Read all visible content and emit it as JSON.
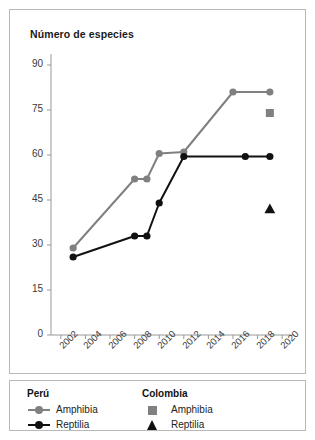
{
  "chart_data": {
    "type": "line",
    "title": "Número de especies",
    "xlabel": "",
    "ylabel": "Número de especies",
    "xlim": [
      2001.2,
      2020.8
    ],
    "ylim": [
      0,
      93
    ],
    "grid": false,
    "legend_position": "below-plot",
    "y_ticks": [
      0,
      15,
      30,
      45,
      60,
      75,
      90
    ],
    "x_ticks": [
      2002,
      2004,
      2006,
      2008,
      2010,
      2012,
      2014,
      2016,
      2018,
      2020
    ],
    "series": [
      {
        "name": "Perú — Amphibia",
        "group": "Perú",
        "taxon": "Amphibia",
        "marker": "circle",
        "color": "#808080",
        "style": "line+marker",
        "points": [
          {
            "x": 2003,
            "y": 29
          },
          {
            "x": 2008,
            "y": 52
          },
          {
            "x": 2009,
            "y": 52
          },
          {
            "x": 2010,
            "y": 60.5
          },
          {
            "x": 2012,
            "y": 61
          },
          {
            "x": 2016,
            "y": 81
          },
          {
            "x": 2019,
            "y": 81
          }
        ]
      },
      {
        "name": "Perú — Reptilia",
        "group": "Perú",
        "taxon": "Reptilia",
        "marker": "circle",
        "color": "#111111",
        "style": "line+marker",
        "points": [
          {
            "x": 2003,
            "y": 26
          },
          {
            "x": 2008,
            "y": 33
          },
          {
            "x": 2009,
            "y": 33
          },
          {
            "x": 2010,
            "y": 44
          },
          {
            "x": 2012,
            "y": 59.5
          },
          {
            "x": 2017,
            "y": 59.5
          },
          {
            "x": 2019,
            "y": 59.5
          }
        ]
      },
      {
        "name": "Colombia — Amphibia",
        "group": "Colombia",
        "taxon": "Amphibia",
        "marker": "square",
        "color": "#808080",
        "style": "marker-only",
        "points": [
          {
            "x": 2019,
            "y": 74
          }
        ]
      },
      {
        "name": "Colombia — Reptilia",
        "group": "Colombia",
        "taxon": "Reptilia",
        "marker": "triangle",
        "color": "#111111",
        "style": "marker-only",
        "points": [
          {
            "x": 2019,
            "y": 42
          }
        ]
      }
    ]
  },
  "legend": {
    "groups": [
      {
        "heading": "Perú",
        "entries": [
          {
            "label": "Amphibia",
            "marker": "circle",
            "color": "#808080",
            "line": true
          },
          {
            "label": "Reptilia",
            "marker": "circle",
            "color": "#111111",
            "line": true
          }
        ]
      },
      {
        "heading": "Colombia",
        "entries": [
          {
            "label": "Amphibia",
            "marker": "square",
            "color": "#808080",
            "line": false
          },
          {
            "label": "Reptilia",
            "marker": "triangle",
            "color": "#111111",
            "line": false
          }
        ]
      }
    ]
  },
  "colors": {
    "peru_amphibia": "#808080",
    "peru_reptilia": "#111111",
    "colombia_amphibia": "#808080",
    "colombia_reptilia": "#111111",
    "axis": "#999999",
    "frame": "#b9b9b9",
    "text": "#333333"
  }
}
